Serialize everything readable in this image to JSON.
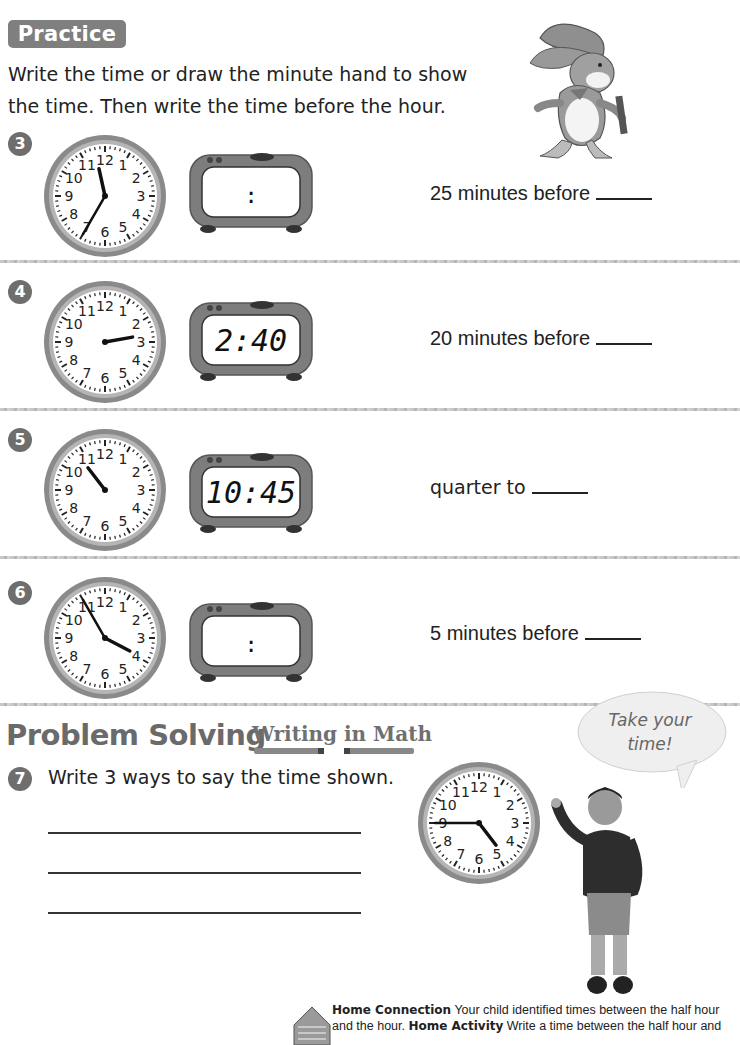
{
  "header": {
    "section_label": "Practice",
    "instructions": "Write the time or draw the minute hand to show the time. Then write the time before the hour."
  },
  "problems": [
    {
      "number": "3",
      "analog": {
        "hour": 11,
        "minute": 35,
        "show_minute_hand": true
      },
      "digital": {
        "display": ":",
        "filled": false
      },
      "answer_prompt": "25 minutes before",
      "answer_value": ""
    },
    {
      "number": "4",
      "analog": {
        "hour": 2,
        "minute": 40,
        "show_minute_hand": false
      },
      "digital": {
        "display": "2:40",
        "filled": true
      },
      "answer_prompt": "20 minutes before",
      "answer_value": ""
    },
    {
      "number": "5",
      "analog": {
        "hour": 10,
        "minute": 45,
        "show_minute_hand": false
      },
      "digital": {
        "display": "10:45",
        "filled": true
      },
      "answer_prompt": "quarter to",
      "answer_value": ""
    },
    {
      "number": "6",
      "analog": {
        "hour": 3,
        "minute": 55,
        "show_minute_hand": true
      },
      "digital": {
        "display": ":",
        "filled": false
      },
      "answer_prompt": "5 minutes before",
      "answer_value": ""
    }
  ],
  "problem_solving": {
    "title": "Problem Solving",
    "subtitle": "Writing in Math",
    "question_number": "7",
    "question": "Write 3 ways to say the time shown.",
    "answer_lines": [
      "",
      "",
      ""
    ],
    "clock": {
      "hour": 4,
      "minute": 45,
      "show_minute_hand": true
    },
    "speech_bubble": "Take your time!"
  },
  "home_connection": {
    "label1": "Home Connection",
    "text1": " Your child identified times between the half hour and the hour. ",
    "label2": "Home Activity",
    "text2": " Write a time between the half hour and"
  },
  "clock_numerals": [
    "12",
    "1",
    "2",
    "3",
    "4",
    "5",
    "6",
    "7",
    "8",
    "9",
    "10",
    "11"
  ],
  "colors": {
    "badge": "#7f7f7f",
    "clock_rim": "#8a8a8a",
    "ink": "#1a1a1a"
  }
}
